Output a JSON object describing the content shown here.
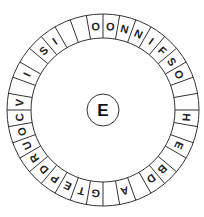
{
  "puzzle": {
    "center_letter": "E",
    "segment_count": 36,
    "ring_letters_clockwise_from_top": [
      "O",
      "N",
      "N",
      "I",
      "F",
      "S",
      "O",
      "",
      "",
      "H",
      "",
      "E",
      "",
      "B",
      "D",
      "",
      "A",
      "",
      "G",
      "T",
      "E",
      "P",
      "D",
      "R",
      "U",
      "O",
      "C",
      "V",
      "",
      "I",
      "",
      "S",
      "I",
      "",
      "",
      "O"
    ],
    "colors": {
      "line": "#333333",
      "text": "#222222",
      "background": "#ffffff"
    }
  }
}
